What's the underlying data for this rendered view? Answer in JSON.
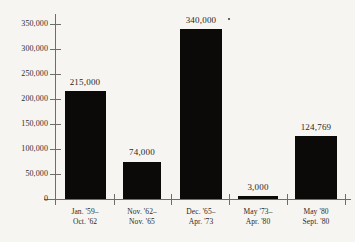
{
  "chart_data": {
    "type": "bar",
    "title": "",
    "subtitle": "",
    "xlabel": "",
    "ylabel": "",
    "ylim": [
      0,
      360000
    ],
    "grid": false,
    "legend": null,
    "axis_color": "#6f6d6a",
    "bar_color": "#0b0a09",
    "text_color": "#2b2927",
    "background": "#f7f5f1",
    "ytick_labels": [
      "0",
      "50,000",
      "100,000",
      "150,000",
      "200,000",
      "250,000",
      "300,000",
      "350,000"
    ],
    "ytick_values": [
      0,
      50000,
      100000,
      150000,
      200000,
      250000,
      300000,
      350000
    ],
    "categories": [
      "Jan. '59– Oct. '62",
      "Nov. '62– Nov. '65",
      "Dec. '65– Apr. '73",
      "May '73– Apr. '80",
      "May '80 Sept. '80"
    ],
    "category_lines": [
      [
        "Jan. '59–",
        "Oct. '62"
      ],
      [
        "Nov. '62–",
        "Nov. '65"
      ],
      [
        "Dec. '65–",
        "Apr. '73"
      ],
      [
        "May '73–",
        "Apr. '80"
      ],
      [
        "May '80",
        "Sept. '80"
      ]
    ],
    "values": [
      215000,
      74000,
      340000,
      3000,
      124769
    ],
    "value_labels": [
      "215,000",
      "74,000",
      "340,000",
      "3,000",
      "124,769"
    ],
    "bars": [
      {
        "label": "Jan. '59– Oct. '62",
        "line1": "Jan. '59–",
        "line2": "Oct. '62",
        "value": 215000,
        "value_label": "215,000",
        "left": 65,
        "width": 41,
        "top": 91,
        "height": 108,
        "label_center": 85,
        "value_top": 77
      },
      {
        "label": "Nov. '62– Nov. '65",
        "line1": "Nov. '62–",
        "line2": "Nov. '65",
        "value": 74000,
        "value_label": "74,000",
        "left": 123,
        "width": 38,
        "top": 162,
        "height": 37,
        "label_center": 142,
        "value_top": 147
      },
      {
        "label": "Dec. '65– Apr. '73",
        "line1": "Dec. '65–",
        "line2": "Apr. '73",
        "value": 340000,
        "value_label": "340,000",
        "left": 180,
        "width": 42,
        "top": 29,
        "height": 170,
        "label_center": 201,
        "value_top": 15
      },
      {
        "label": "May '73– Apr. '80",
        "line1": "May '73–",
        "line2": "Apr. '80",
        "value": 3000,
        "value_label": "3,000",
        "left": 238,
        "width": 40,
        "top": 196,
        "height": 3,
        "label_center": 258,
        "value_top": 182
      },
      {
        "label": "May '80 Sept. '80",
        "line1": "May '80",
        "line2": "Sept. '80",
        "value": 124769,
        "value_label": "124,769",
        "left": 295,
        "width": 42,
        "top": 136,
        "height": 63,
        "label_center": 316,
        "value_top": 122
      }
    ],
    "ytick_positions": [
      199,
      174,
      149,
      124,
      99,
      74,
      49,
      24
    ],
    "xtick_positions": [
      55,
      114,
      171,
      229,
      287,
      345
    ],
    "artifacts": [
      {
        "name": "print-speck",
        "left": 228,
        "top": 18
      }
    ]
  }
}
